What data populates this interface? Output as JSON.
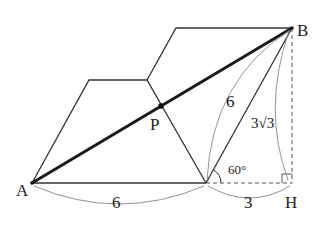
{
  "diagram": {
    "type": "geometry",
    "points": {
      "A": {
        "label": "A",
        "x": 32,
        "y": 183
      },
      "B": {
        "label": "B",
        "x": 292,
        "y": 28
      },
      "H": {
        "label": "H",
        "x": 292,
        "y": 183
      },
      "P": {
        "label": "P",
        "x": 161,
        "y": 106
      },
      "C": {
        "x": 206,
        "y": 183
      },
      "M": {
        "x": 147,
        "y": 80
      },
      "TL": {
        "x": 89,
        "y": 80
      },
      "TR": {
        "x": 176,
        "y": 28
      }
    },
    "measurements": {
      "AC": "6",
      "CB": "6",
      "CH": "3",
      "BH": "3√3",
      "angle": "60°"
    },
    "colors": {
      "line": "#333333",
      "thick": "#1a1a1a",
      "arc": "#777777"
    }
  }
}
